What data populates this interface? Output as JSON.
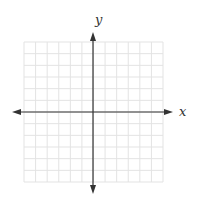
{
  "chart_data": {
    "type": "coordinate-grid",
    "title": "",
    "xlabel": "x",
    "ylabel": "y",
    "grid": true,
    "grid_cells": [
      12,
      12
    ],
    "xlim": [
      -6,
      6
    ],
    "ylim": [
      -6,
      6
    ],
    "axes_arrows": true,
    "tick_labels": []
  },
  "labels": {
    "x": "x",
    "y": "y"
  },
  "colors": {
    "grid": "#e3e3e3",
    "axis": "#333333",
    "background": "#ffffff"
  }
}
